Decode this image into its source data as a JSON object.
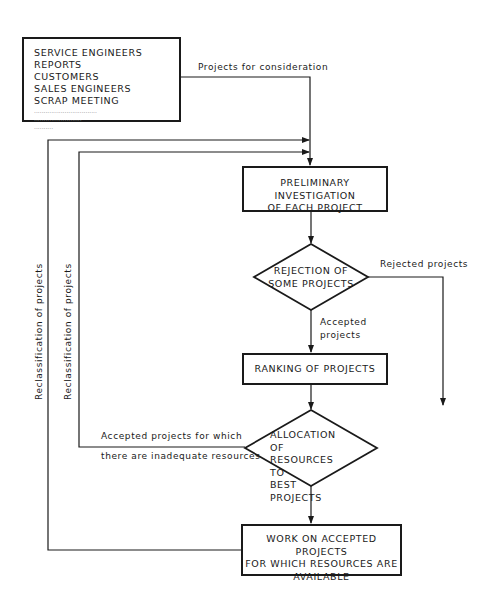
{
  "source_box": {
    "lines": [
      "SERVICE ENGINEERS REPORTS",
      "CUSTOMERS",
      "SALES ENGINEERS",
      "SCRAP MEETING"
    ],
    "placeholders": [
      ".................................",
      ".........................",
      ".........."
    ]
  },
  "edges": {
    "to_investigation": "Projects for consideration",
    "rejected": "Rejected projects",
    "accepted_line1": "Accepted",
    "accepted_line2": "projects",
    "inadequate_line1": "Accepted projects for which",
    "inadequate_line2": "there are inadequate resources",
    "reclass_outer": "Reclassification of projects",
    "reclass_inner": "Reclassification of projects"
  },
  "nodes": {
    "investigation": {
      "line1": "PRELIMINARY INVESTIGATION",
      "line2": "OF EACH PROJECT"
    },
    "rejection": {
      "line1": "REJECTION OF",
      "line2": "SOME PROJECTS"
    },
    "ranking": {
      "line1": "RANKING OF PROJECTS"
    },
    "allocation": {
      "line1": "ALLOCATION OF",
      "line2": "RESOURCES TO",
      "line3": "BEST PROJECTS"
    },
    "work": {
      "line1": "WORK ON ACCEPTED PROJECTS",
      "line2": "FOR WHICH RESOURCES ARE",
      "line3": "AVAILABLE"
    }
  }
}
